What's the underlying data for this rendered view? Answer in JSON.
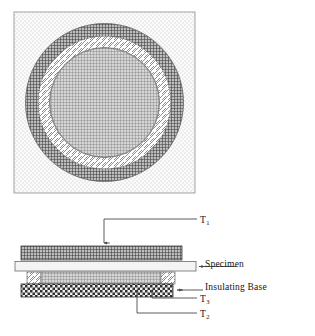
{
  "figure": {
    "plan_view": {
      "name": "circular-plan-view",
      "frame": {
        "x": 14,
        "y": 12,
        "width": 181,
        "height": 181,
        "fill": "stipple-light",
        "border": "#8a8a8a"
      },
      "rings": [
        {
          "name": "guard-ring",
          "outer_r": 79,
          "inner_r": 66,
          "pattern": "dark-crosshatch",
          "color": "#4a4a4a"
        },
        {
          "name": "air-gap-ring",
          "outer_r": 66,
          "inner_r": 55,
          "pattern": "diagonal-hatch",
          "color": "#ffffff"
        },
        {
          "name": "main-heater-disc",
          "outer_r": 55,
          "inner_r": 0,
          "pattern": "fine-grid",
          "color": "#909090"
        }
      ],
      "center": {
        "cx": 104.5,
        "cy": 102.5
      }
    },
    "cross_section": {
      "name": "cross-section-view",
      "layers": [
        {
          "name": "top-heater-plate",
          "x": 21,
          "y": 246,
          "width": 161,
          "height": 14,
          "pattern": "dark-crosshatch",
          "color": "#555555"
        },
        {
          "name": "specimen-plate",
          "x": 15,
          "y": 261,
          "width": 181,
          "height": 10,
          "pattern": "plain-light",
          "color": "#f2f2f2"
        },
        {
          "name": "guard-spacer-left",
          "x": 27,
          "y": 272,
          "width": 13,
          "height": 12,
          "pattern": "diagonal-hatch",
          "color": "#ffffff"
        },
        {
          "name": "lower-heater-plate",
          "x": 40,
          "y": 272,
          "width": 122,
          "height": 12,
          "pattern": "mid-grid",
          "color": "#9a9a9a"
        },
        {
          "name": "guard-spacer-right",
          "x": 162,
          "y": 272,
          "width": 13,
          "height": 12,
          "pattern": "diagonal-hatch",
          "color": "#ffffff"
        },
        {
          "name": "insulating-base-block",
          "x": 21,
          "y": 284,
          "width": 152,
          "height": 13,
          "pattern": "checkerboard",
          "color": "#3c3c3c"
        }
      ]
    }
  },
  "labels": {
    "t1": "T",
    "t1_sub": "1",
    "specimen": "Specimen",
    "insulating_base": "Insulating Base",
    "t3": "T",
    "t3_sub": "3",
    "t2": "T",
    "t2_sub": "2"
  },
  "leaders": [
    {
      "name": "leader-t1",
      "from": "T1-label",
      "to": "top-heater-plate",
      "arrow": "down"
    },
    {
      "name": "leader-specimen",
      "from": "Specimen-label",
      "to": "specimen-plate",
      "arrow": "left"
    },
    {
      "name": "leader-insulating-base",
      "from": "Insulating-Base-label",
      "to": "insulating-base-block",
      "arrow": "left"
    },
    {
      "name": "leader-t3",
      "from": "T3-label",
      "to": "insulating-base-block",
      "arrow": "up"
    },
    {
      "name": "leader-t2",
      "from": "T2-label",
      "to": "insulating-base-block",
      "arrow": "up"
    }
  ],
  "colors": {
    "ink": "#141414",
    "line": "#5a5a5a",
    "dark_hatch": "#4a4a4a",
    "mid_grid": "#909090",
    "light_fill": "#f2f2f2",
    "page": "#ffffff"
  }
}
